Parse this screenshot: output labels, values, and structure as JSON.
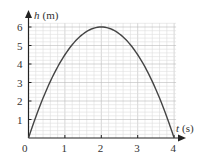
{
  "chart_data": {
    "type": "line",
    "title": "",
    "xlabel": "t (s)",
    "ylabel": "h (m)",
    "xlabel_var": "t",
    "xlabel_unit": "(s)",
    "ylabel_var": "h",
    "ylabel_unit": "(m)",
    "xlim": [
      0,
      4
    ],
    "ylim": [
      0,
      6
    ],
    "x_ticks": [
      "0",
      "1",
      "2",
      "3",
      "4"
    ],
    "y_ticks": [
      "1",
      "2",
      "3",
      "4",
      "5",
      "6"
    ],
    "grid": true,
    "minor_divisions": 5,
    "series": [
      {
        "name": "h(t)",
        "equation": "h = 6t - 1.5t^2",
        "x": [
          0,
          0.5,
          1,
          1.5,
          2,
          2.5,
          3,
          3.5,
          4
        ],
        "values": [
          0,
          2.625,
          4.5,
          5.625,
          6,
          5.625,
          4.5,
          2.625,
          0
        ]
      }
    ],
    "colors": {
      "curve": "#444444",
      "axis": "#222222",
      "grid_minor": "#dddddd",
      "grid_major": "#bbbbbb"
    }
  }
}
